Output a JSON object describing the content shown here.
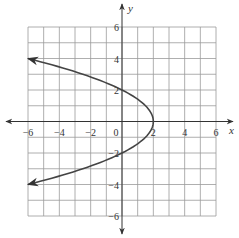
{
  "chart_data": {
    "type": "line",
    "title": "",
    "xlabel": "x",
    "ylabel": "y",
    "xlim": [
      -6,
      6
    ],
    "ylim": [
      -6,
      6
    ],
    "grid": true,
    "grid_step": 1,
    "x_ticks": [
      -6,
      -4,
      -2,
      0,
      2,
      4,
      6
    ],
    "y_ticks": [
      -6,
      -4,
      -2,
      2,
      4,
      6
    ],
    "x_tick_labels": [
      "−6",
      "−4",
      "−2",
      "0",
      "2",
      "4",
      "6"
    ],
    "y_tick_labels": [
      "−6",
      "−4",
      "−2",
      "2",
      "4",
      "6"
    ],
    "series": [
      {
        "name": "sideways parabola x = 2 − y²/2",
        "description": "Parabola opening left with vertex at (2, 0), arrows at both ends",
        "points": [
          {
            "x": -6,
            "y": 4
          },
          {
            "x": -2.5,
            "y": 3
          },
          {
            "x": 0,
            "y": 2
          },
          {
            "x": 1.5,
            "y": 1
          },
          {
            "x": 2,
            "y": 0
          },
          {
            "x": 1.5,
            "y": -1
          },
          {
            "x": 0,
            "y": -2
          },
          {
            "x": -2.5,
            "y": -3
          },
          {
            "x": -6,
            "y": -4
          }
        ],
        "vertex": {
          "x": 2,
          "y": 0
        },
        "arrows_at_ends": true
      }
    ],
    "colors": {
      "grid": "#9a9a9a",
      "axis": "#333333",
      "curve": "#444444"
    }
  }
}
